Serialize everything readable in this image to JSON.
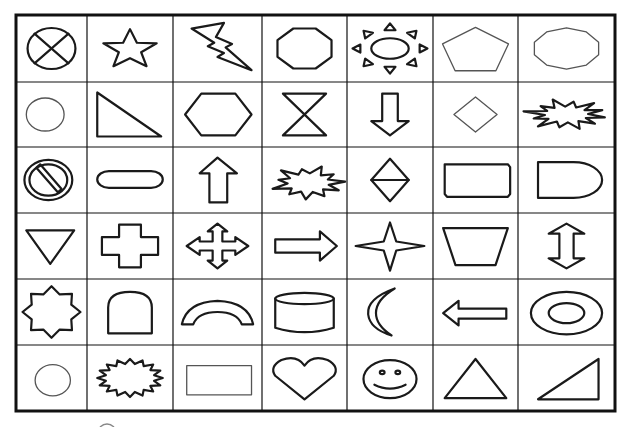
{
  "sheet": {
    "title": "Shapes worksheet",
    "rows": 6,
    "cols": 7,
    "line_color": "#111111",
    "grid": {
      "x": [
        16,
        87,
        173,
        262,
        347,
        433,
        518,
        615
      ],
      "y": [
        15,
        82,
        147,
        213,
        279,
        345,
        411
      ]
    },
    "cells": [
      [
        {
          "shape": "crossed-circle",
          "label": "Circle with X"
        },
        {
          "shape": "star",
          "label": "Star"
        },
        {
          "shape": "lightning-bolt",
          "label": "Lightning bolt"
        },
        {
          "shape": "octagon",
          "label": "Octagon"
        },
        {
          "shape": "sun",
          "label": "Sun"
        },
        {
          "shape": "pentagon",
          "label": "Pentagon"
        },
        {
          "shape": "decagon",
          "label": "Decagon"
        }
      ],
      [
        {
          "shape": "ellipse",
          "label": "Ellipse"
        },
        {
          "shape": "right-triangle",
          "label": "Right triangle"
        },
        {
          "shape": "hexagon",
          "label": "Hexagon"
        },
        {
          "shape": "hourglass",
          "label": "Hourglass"
        },
        {
          "shape": "arrow-down",
          "label": "Down arrow"
        },
        {
          "shape": "diamond",
          "label": "Diamond"
        },
        {
          "shape": "explosion",
          "label": "Explosion"
        }
      ],
      [
        {
          "shape": "no-symbol",
          "label": "No symbol"
        },
        {
          "shape": "rounded-pill",
          "label": "Rounded rectangle (pill)"
        },
        {
          "shape": "arrow-up",
          "label": "Up arrow"
        },
        {
          "shape": "explosion-2",
          "label": "Explosion 2"
        },
        {
          "shape": "split-diamond",
          "label": "Split diamond"
        },
        {
          "shape": "snipped-rectangle",
          "label": "Snipped corner rectangle"
        },
        {
          "shape": "delay",
          "label": "Delay (D shape)"
        }
      ],
      [
        {
          "shape": "inverted-triangle",
          "label": "Inverted triangle"
        },
        {
          "shape": "plus-cross",
          "label": "Plus / cross"
        },
        {
          "shape": "quad-arrow",
          "label": "Four-way arrow"
        },
        {
          "shape": "arrow-right",
          "label": "Right arrow"
        },
        {
          "shape": "four-point-star",
          "label": "Four-point star"
        },
        {
          "shape": "trapezoid",
          "label": "Trapezoid"
        },
        {
          "shape": "up-down-arrow",
          "label": "Up-down arrow"
        }
      ],
      [
        {
          "shape": "eight-point-star",
          "label": "Eight-point star"
        },
        {
          "shape": "arch-door",
          "label": "Arch (tombstone)"
        },
        {
          "shape": "block-arc",
          "label": "Block arc"
        },
        {
          "shape": "cylinder",
          "label": "Cylinder"
        },
        {
          "shape": "moon",
          "label": "Crescent moon"
        },
        {
          "shape": "arrow-left",
          "label": "Left arrow"
        },
        {
          "shape": "donut",
          "label": "Donut"
        }
      ],
      [
        {
          "shape": "circle",
          "label": "Circle"
        },
        {
          "shape": "seal-burst",
          "label": "Starburst seal"
        },
        {
          "shape": "rectangle",
          "label": "Rectangle"
        },
        {
          "shape": "heart",
          "label": "Heart"
        },
        {
          "shape": "smiley",
          "label": "Smiley face"
        },
        {
          "shape": "triangle",
          "label": "Triangle"
        },
        {
          "shape": "right-triangle-2",
          "label": "Right triangle (mirrored)"
        }
      ]
    ]
  }
}
